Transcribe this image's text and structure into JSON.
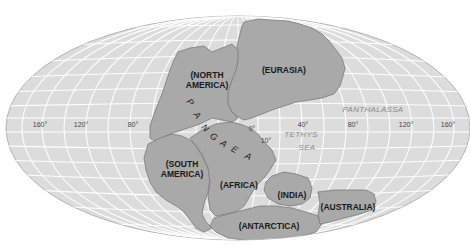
{
  "map": {
    "projection": "mollweide-style world map (Pangaea reconstruction)",
    "colors": {
      "ocean": "#dcdcdc",
      "land": "#a9a9a9",
      "land_outline": "#7a7a7a",
      "graticule": "#ffffff",
      "background": "#ffffff"
    },
    "supercontinent": {
      "label_letters": [
        "P",
        "A",
        "N",
        "G",
        "A",
        "E",
        "A"
      ]
    },
    "continents": [
      {
        "id": "north-america",
        "line1": "(NORTH",
        "line2": "AMERICA)"
      },
      {
        "id": "eurasia",
        "line1": "(EURASIA)"
      },
      {
        "id": "south-america",
        "line1": "(SOUTH",
        "line2": "AMERICA)"
      },
      {
        "id": "africa",
        "line1": "(AFRICA)"
      },
      {
        "id": "india",
        "line1": "(INDIA)"
      },
      {
        "id": "antarctica",
        "line1": "(ANTARCTICA)"
      },
      {
        "id": "australia",
        "line1": "(AUSTRALIA)"
      }
    ],
    "oceans": [
      {
        "id": "panthalassa",
        "line1": "PANTHALASSA"
      },
      {
        "id": "tethys-sea",
        "line1": "TETHYS",
        "line2": "SEA"
      }
    ],
    "longitude_labels": [
      "160°",
      "120°",
      "80°",
      "0°",
      "40°",
      "80°",
      "120°",
      "160°"
    ],
    "latitude_label": "10°"
  }
}
